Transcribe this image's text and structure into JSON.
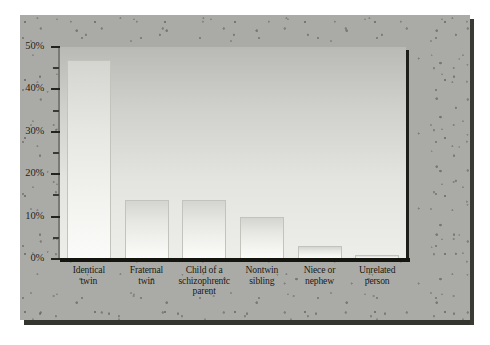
{
  "chart_data": {
    "type": "bar",
    "title": "",
    "subtitle": "",
    "xlabel": "",
    "ylabel": "",
    "categories": [
      "Identical\ntwin",
      "Fraternal\ntwin",
      "Child of a\nschizophrenic\nparent",
      "Nontwin\nsibling",
      "Niece or\nnephew",
      "Unrelated\nperson"
    ],
    "category_lines": [
      [
        "Identical",
        "twin"
      ],
      [
        "Fraternal",
        "twin"
      ],
      [
        "Child of a",
        "schizophrenic",
        "parent"
      ],
      [
        "Nontwin",
        "sibling"
      ],
      [
        "Niece or",
        "nephew"
      ],
      [
        "Unrelated",
        "person"
      ]
    ],
    "values": [
      47,
      14,
      14,
      10,
      3,
      1
    ],
    "ylim": [
      0,
      50
    ],
    "ytick_labels": [
      "50%",
      "40%",
      "30%",
      "20%",
      "10%",
      "0%"
    ],
    "ytick_values": [
      50,
      40,
      30,
      20,
      10,
      0
    ],
    "yminor_values": [
      45,
      35,
      25,
      15,
      5
    ],
    "grid": false,
    "legend": null,
    "legend_position": "none",
    "colors": {
      "bar_fill_top": "#d4d4d0",
      "bar_fill_bottom": "#fbfbf9",
      "bar_border": "#c3c3bd",
      "plot_bg_top": "#b9b9b5",
      "plot_bg_bottom": "#ededea",
      "card_bg": "#aaaaa6",
      "axis": "#15150f",
      "text": "#16160f",
      "page_bg": "#ffffff"
    }
  }
}
